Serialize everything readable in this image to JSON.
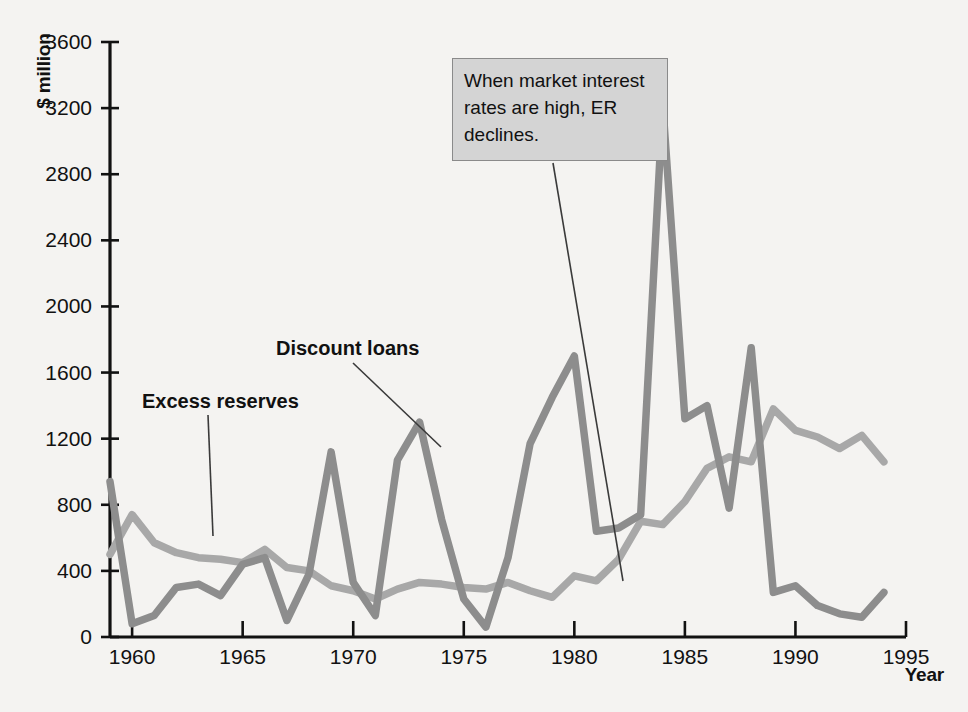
{
  "chart_data": {
    "type": "line",
    "title": "",
    "xlabel": "Year",
    "ylabel": "$ million",
    "xlim": [
      1959,
      1995
    ],
    "ylim": [
      0,
      3600
    ],
    "xticks": [
      1960,
      1965,
      1970,
      1975,
      1980,
      1985,
      1990,
      1995
    ],
    "yticks": [
      0,
      400,
      800,
      1200,
      1600,
      2000,
      2400,
      2800,
      3200,
      3600
    ],
    "grid": false,
    "legend_position": "inline-labels",
    "x": [
      1959,
      1960,
      1961,
      1962,
      1963,
      1964,
      1965,
      1966,
      1967,
      1968,
      1969,
      1970,
      1971,
      1972,
      1973,
      1974,
      1975,
      1976,
      1977,
      1978,
      1979,
      1980,
      1981,
      1982,
      1983,
      1984,
      1985,
      1986,
      1987,
      1988,
      1989,
      1990,
      1991,
      1992,
      1993,
      1994
    ],
    "series": [
      {
        "name": "Excess reserves",
        "color": "#a8a8a8",
        "values": [
          500,
          740,
          570,
          510,
          480,
          470,
          450,
          530,
          420,
          400,
          310,
          280,
          230,
          290,
          330,
          320,
          300,
          290,
          330,
          280,
          240,
          370,
          340,
          470,
          700,
          680,
          820,
          1020,
          1090,
          1060,
          1380,
          1250,
          1210,
          1140,
          1220,
          1060
        ]
      },
      {
        "name": "Discount loans",
        "color": "#8d8d8d",
        "values": [
          940,
          80,
          130,
          300,
          320,
          250,
          440,
          480,
          100,
          380,
          1120,
          330,
          130,
          1070,
          1300,
          710,
          230,
          60,
          480,
          1170,
          1450,
          1700,
          640,
          660,
          740,
          3220,
          1320,
          1400,
          780,
          1750,
          270,
          310,
          190,
          140,
          120,
          270
        ]
      }
    ]
  },
  "axis": {
    "ylabel": "$ million",
    "xlabel": "Year",
    "ytick_labels": [
      "3600",
      "3200",
      "2800",
      "2400",
      "2000",
      "1600",
      "1200",
      "800",
      "400",
      "0"
    ],
    "xtick_labels": [
      "1960",
      "1965",
      "1970",
      "1975",
      "1980",
      "1985",
      "1990",
      "1995"
    ]
  },
  "series_labels": {
    "excess_reserves": "Excess reserves",
    "discount_loans": "Discount loans"
  },
  "annotation": {
    "text": "When market interest rates are high, ER declines."
  },
  "colors": {
    "background": "#f4f3f1",
    "axis": "#111111",
    "excess_reserves_line": "#a8a8a8",
    "discount_loans_line": "#8d8d8d",
    "annotation_bg": "#d4d4d4",
    "annotation_border": "#8a8a8a",
    "leader_line": "#3a3a3a"
  }
}
